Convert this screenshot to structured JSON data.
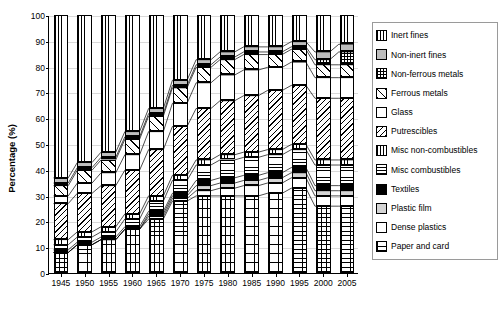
{
  "chart_data": {
    "type": "area",
    "title": "",
    "xlabel": "",
    "ylabel": "Percentage (%)",
    "ylim": [
      0,
      100
    ],
    "yticks": [
      0,
      10,
      20,
      30,
      40,
      50,
      60,
      70,
      80,
      90,
      100
    ],
    "grid": true,
    "legend_position": "right",
    "categories": [
      "1945",
      "1950",
      "1955",
      "1960",
      "1965",
      "1970",
      "1975",
      "1980",
      "1985",
      "1990",
      "1995",
      "2000",
      "2005"
    ],
    "series": [
      {
        "name": "Paper and card",
        "pattern": "grid-squares",
        "values": [
          8,
          11,
          13,
          17,
          21,
          28,
          30,
          30,
          30,
          31,
          33,
          26,
          26
        ]
      },
      {
        "name": "Dense plastics",
        "pattern": "white-plain",
        "values": [
          0,
          0,
          0,
          0,
          1,
          1,
          2,
          3,
          4,
          4,
          4,
          4,
          4
        ]
      },
      {
        "name": "Plastic film",
        "pattern": "light-gray",
        "values": [
          0,
          0,
          0,
          0,
          1,
          1,
          2,
          2,
          2,
          2,
          2,
          2,
          2
        ]
      },
      {
        "name": "Textiles",
        "pattern": "solid-black",
        "values": [
          1,
          1,
          1,
          1,
          1,
          1,
          2,
          2,
          2,
          2,
          2,
          2,
          2
        ]
      },
      {
        "name": "Misc combustibles",
        "pattern": "horizontal-lines",
        "values": [
          2,
          2,
          2,
          3,
          4,
          5,
          6,
          7,
          7,
          7,
          7,
          8,
          8
        ]
      },
      {
        "name": "Misc non-combustibles",
        "pattern": "vertical-lines",
        "values": [
          2,
          2,
          2,
          2,
          2,
          2,
          2,
          2,
          2,
          2,
          2,
          2,
          2
        ]
      },
      {
        "name": "Putrescibles",
        "pattern": "diagonal-back",
        "values": [
          14,
          15,
          16,
          17,
          18,
          19,
          20,
          21,
          22,
          23,
          23,
          24,
          24
        ]
      },
      {
        "name": "Glass",
        "pattern": "white-outline",
        "values": [
          3,
          4,
          5,
          6,
          7,
          9,
          10,
          10,
          10,
          9,
          9,
          8,
          8
        ]
      },
      {
        "name": "Ferrous metals",
        "pattern": "diagonal-fwd",
        "values": [
          4,
          5,
          5,
          6,
          6,
          6,
          6,
          6,
          6,
          5,
          5,
          5,
          5
        ]
      },
      {
        "name": "Non-ferrous metals",
        "pattern": "checker-dark",
        "values": [
          1,
          1,
          1,
          1,
          1,
          1,
          1,
          1,
          1,
          1,
          1,
          2,
          5
        ]
      },
      {
        "name": "Non-inert fines",
        "pattern": "mid-gray",
        "values": [
          2,
          2,
          2,
          2,
          2,
          2,
          2,
          2,
          2,
          2,
          2,
          3,
          3
        ]
      },
      {
        "name": "Inert fines",
        "pattern": "fine-vertical",
        "values": [
          63,
          57,
          53,
          45,
          36,
          25,
          17,
          14,
          12,
          12,
          10,
          14,
          11
        ]
      }
    ]
  },
  "legend": {
    "items": [
      {
        "label": "Inert fines",
        "pattern": "fine-vertical"
      },
      {
        "label": "Non-inert fines",
        "pattern": "mid-gray"
      },
      {
        "label": "Non-ferrous metals",
        "pattern": "checker-dark"
      },
      {
        "label": "Ferrous metals",
        "pattern": "diagonal-fwd"
      },
      {
        "label": "Glass",
        "pattern": "white-outline"
      },
      {
        "label": "Putrescibles",
        "pattern": "diagonal-back"
      },
      {
        "label": "Misc non-combustibles",
        "pattern": "vertical-lines"
      },
      {
        "label": "Misc combustibles",
        "pattern": "horizontal-lines"
      },
      {
        "label": "Textiles",
        "pattern": "solid-black"
      },
      {
        "label": "Plastic film",
        "pattern": "light-gray"
      },
      {
        "label": "Dense plastics",
        "pattern": "white-plain"
      },
      {
        "label": "Paper and card",
        "pattern": "grid-squares"
      }
    ]
  }
}
